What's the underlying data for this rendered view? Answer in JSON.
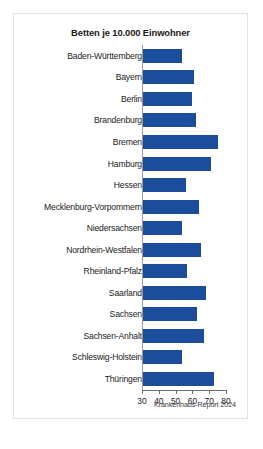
{
  "figure": {
    "title": "Betten je 10.000 Einwohner",
    "source": "Krankenhaus-Report 2024",
    "bar_color": "#1c4c9c",
    "axis_color": "#6e6e72",
    "background": "#ffffff",
    "border_color": "#e3e3e5"
  },
  "chart_data": {
    "type": "bar",
    "orientation": "horizontal",
    "title": "Betten je 10.000 Einwohner",
    "xlabel": "",
    "ylabel": "",
    "xlim": [
      30,
      80
    ],
    "grid": false,
    "legend": null,
    "annotations": [
      "Krankenhaus-Report 2024"
    ],
    "xticks": [
      30,
      40,
      50,
      60,
      70,
      80
    ],
    "xticklabels": [
      "30",
      "40",
      "50",
      "60",
      "70",
      "80"
    ],
    "categories": [
      "Baden-Württemberg",
      "Bayern",
      "Berlin",
      "Brandenburg",
      "Bremen",
      "Hamburg",
      "Hessen",
      "Mecklenburg-Vorpommern",
      "Niedersachsen",
      "Nordrhein-Westfalen",
      "Rheinland-Pfalz",
      "Saarland",
      "Sachsen",
      "Sachsen-Anhalt",
      "Schleswig-Holstein",
      "Thüringen"
    ],
    "values": [
      54,
      61,
      60,
      62,
      75,
      71,
      56,
      64,
      54,
      65,
      57,
      68,
      63,
      67,
      54,
      73
    ]
  }
}
